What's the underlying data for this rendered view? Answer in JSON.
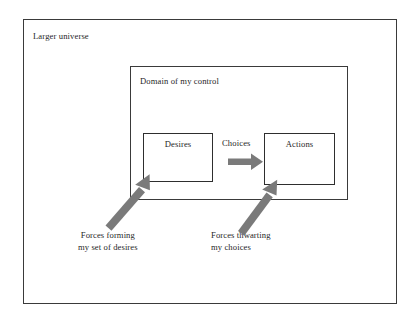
{
  "diagram": {
    "title_outer": "Larger universe",
    "title_domain": "Domain of my control",
    "boxes": {
      "desires": "Desires",
      "actions": "Actions"
    },
    "flow_label": "Choices",
    "captions": {
      "forces_desires": {
        "line1": "Forces forming",
        "line2": "my set of desires"
      },
      "forces_choices": {
        "line1": "Forces thwarting",
        "line2": "my choices"
      }
    },
    "colors": {
      "border": "#3a3a3a",
      "box_border": "#2e2e2e",
      "arrow_gray": "#7a7a7a",
      "text": "#1f1f1f",
      "background": "#ffffff"
    }
  }
}
